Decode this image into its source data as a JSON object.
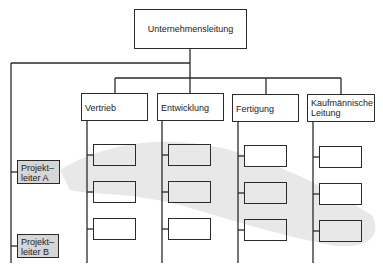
{
  "title": "Unternehmensleitung",
  "departments": [
    {
      "label": "Vertrieb"
    },
    {
      "label": "Entwicklung"
    },
    {
      "label": "Fertigung"
    },
    {
      "label": "Kaufmännische Leitung",
      "line1": "Kaufmännische",
      "line2": "Leitung"
    }
  ],
  "project_leaders": [
    {
      "line1": "Projekt–",
      "line2": "leiter A"
    },
    {
      "line1": "Projekt–",
      "line2": "leiter B"
    }
  ],
  "sub_boxes_per_department": 3,
  "colors": {
    "line": "#2a2a2a",
    "project_leader_fill": "#d6d6d6",
    "swoosh": "#e8e8e8"
  }
}
